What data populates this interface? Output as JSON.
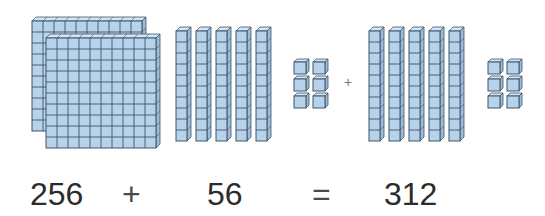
{
  "colors": {
    "cube_fill": "#b7d3ec",
    "cube_top": "#d3e5f5",
    "cube_side": "#9dbcd8",
    "grid_line": "#3f5468",
    "text": "#2b2b2b"
  },
  "addend1": {
    "value": "256",
    "blocks": {
      "hundreds_flats": 2,
      "tens_rods": 5,
      "ones_units": 6
    }
  },
  "addend2": {
    "value": "56",
    "blocks": {
      "hundreds_flats": 0,
      "tens_rods": 5,
      "ones_units": 6
    }
  },
  "blocks_plus": "+",
  "equation": {
    "left": "256",
    "plus": "+",
    "right": "56",
    "equals": "=",
    "result": "312"
  }
}
